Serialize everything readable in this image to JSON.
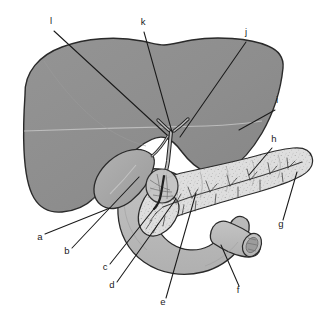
{
  "figure": {
    "background_color": "#ffffff"
  },
  "colors": {
    "liver_fill": "#8f8f8f",
    "liver_stroke": "#2a2a2a",
    "gallbladder_fill": "#a8a8a8",
    "gallbladder_stroke": "#2a2a2a",
    "duodenum_fill": "#bdbdbd",
    "duodenum_stroke": "#2a2a2a",
    "pancreas_fill": "#dcdcdc",
    "pancreas_stroke": "#2a2a2a",
    "duct_fill": "#c9c9c9",
    "duct_stroke": "#1f1f1f",
    "ampulla_fill": "#c4c4c4",
    "leader_line": "#1a1a1a",
    "label_text": "#1a1a1a",
    "highlight_line": "#c8c8c8"
  },
  "labels": [
    {
      "id": "a",
      "text": "a",
      "x": 40,
      "y": 240,
      "target_x": 110,
      "target_y": 208
    },
    {
      "id": "b",
      "text": "b",
      "x": 67,
      "y": 254,
      "target_x": 139,
      "target_y": 177
    },
    {
      "id": "c",
      "text": "c",
      "x": 105,
      "y": 270,
      "target_x": 157,
      "target_y": 205
    },
    {
      "id": "d",
      "text": "d",
      "x": 112,
      "y": 288,
      "target_x": 176,
      "target_y": 199
    },
    {
      "id": "e",
      "text": "e",
      "x": 163,
      "y": 305,
      "target_x": 196,
      "target_y": 193
    },
    {
      "id": "f",
      "text": "f",
      "x": 238,
      "y": 293,
      "target_x": 221,
      "target_y": 245
    },
    {
      "id": "g",
      "text": "g",
      "x": 281,
      "y": 227,
      "target_x": 297,
      "target_y": 172
    },
    {
      "id": "h",
      "text": "h",
      "x": 274,
      "y": 142,
      "target_x": 249,
      "target_y": 175
    },
    {
      "id": "i",
      "text": "i",
      "x": 277,
      "y": 103,
      "target_x": 239,
      "target_y": 130
    },
    {
      "id": "j",
      "text": "j",
      "x": 246,
      "y": 35,
      "target_x": 180,
      "target_y": 137
    },
    {
      "id": "k",
      "text": "k",
      "x": 143,
      "y": 25,
      "target_x": 172,
      "target_y": 132
    },
    {
      "id": "l",
      "text": "l",
      "x": 51,
      "y": 24,
      "target_x": 167,
      "target_y": 135
    }
  ],
  "organs": [
    {
      "id": "liver",
      "name": "Liver"
    },
    {
      "id": "gallbladder",
      "name": "Gallbladder"
    },
    {
      "id": "duodenum",
      "name": "Duodenum"
    },
    {
      "id": "pancreas",
      "name": "Pancreas"
    },
    {
      "id": "bile-duct",
      "name": "Common bile duct"
    },
    {
      "id": "cystic-duct",
      "name": "Cystic duct"
    },
    {
      "id": "ampulla",
      "name": "Ampulla / duodenal papilla region"
    },
    {
      "id": "pancreatic-duct",
      "name": "Pancreatic duct"
    }
  ]
}
